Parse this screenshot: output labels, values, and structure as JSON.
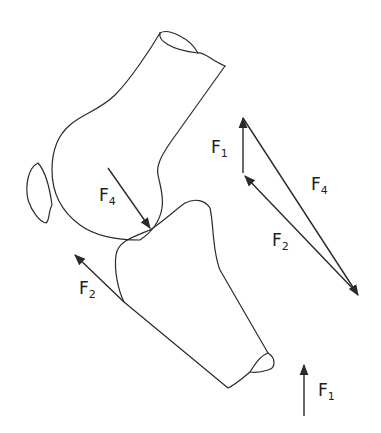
{
  "diagram": {
    "type": "knee-joint-force-diagram",
    "stroke_color": "#2a2a2a",
    "labels": {
      "f4_on_joint": {
        "base": "F",
        "sub": "4"
      },
      "f2_on_tibia": {
        "base": "F",
        "sub": "2"
      },
      "f1_triangle": {
        "base": "F",
        "sub": "1"
      },
      "f4_triangle": {
        "base": "F",
        "sub": "4"
      },
      "f2_triangle": {
        "base": "F",
        "sub": "2"
      },
      "f1_bottom": {
        "base": "F",
        "sub": "1"
      }
    },
    "parts": [
      "femur",
      "patella",
      "tibia",
      "force-triangle"
    ]
  }
}
